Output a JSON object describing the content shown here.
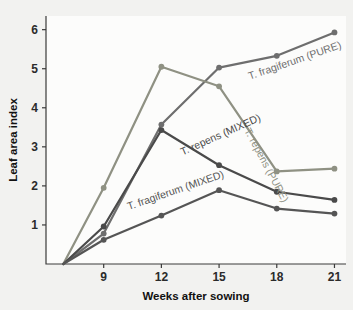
{
  "figure": {
    "background_color": "#f2f2f0",
    "plot_background_color": "#fcfcfb",
    "axis_color": "#3a3a3a"
  },
  "chart_data": {
    "type": "line",
    "title": "",
    "subtitle": "",
    "xlabel": "Weeks after sowing",
    "ylabel": "Leaf area index",
    "x": [
      6.9,
      9,
      12,
      15,
      18,
      21
    ],
    "xlim": [
      6.0,
      21.6
    ],
    "ylim": [
      0,
      6.35
    ],
    "xticks": [
      9,
      12,
      15,
      18,
      21
    ],
    "xticklabels": [
      "9",
      "12",
      "15",
      "18",
      "21"
    ],
    "yticks": [
      1,
      2,
      3,
      4,
      5,
      6
    ],
    "yticklabels": [
      "1",
      "2",
      "3",
      "4",
      "5",
      "6"
    ],
    "grid": false,
    "legend": "inline-labels",
    "legend_position": "inline",
    "markers": "circle",
    "series": [
      {
        "name": "T. fragiferum (PURE)",
        "label": "T. fragiferum (PURE)",
        "color": "#6e6e6e",
        "values": [
          0.0,
          0.78,
          3.57,
          5.03,
          5.33,
          5.93
        ]
      },
      {
        "name": "T. repens (PURE)",
        "label": "T. repens (PURE)",
        "color": "#8f9183",
        "values": [
          0.0,
          1.95,
          5.05,
          4.55,
          2.37,
          2.44
        ]
      },
      {
        "name": "T. repens (MIXED)",
        "label": "T. repens (MIXED)",
        "color": "#4a4a4a",
        "values": [
          0.0,
          0.96,
          3.43,
          2.53,
          1.85,
          1.64
        ]
      },
      {
        "name": "T. fragiferum (MIXED)",
        "label": "T. fragiferum (MIXED)",
        "color": "#555555",
        "values": [
          0.0,
          0.62,
          1.24,
          1.89,
          1.42,
          1.29
        ]
      }
    ],
    "annotations": [
      {
        "text": "T. fragiferum (PURE)",
        "x": 16.6,
        "y": 4.72,
        "rotation": -19,
        "color": "#6e6e6e"
      },
      {
        "text": "T. repens (PURE)",
        "x": 16.3,
        "y": 3.42,
        "rotation": 62,
        "color": "#8f9183"
      },
      {
        "text": "T. repens (MIXED)",
        "x": 13.1,
        "y": 2.78,
        "rotation": -24,
        "color": "#4a4a4a"
      },
      {
        "text": "T. fragiferum (MIXED)",
        "x": 10.3,
        "y": 1.38,
        "rotation": -19,
        "color": "#555555"
      }
    ]
  }
}
